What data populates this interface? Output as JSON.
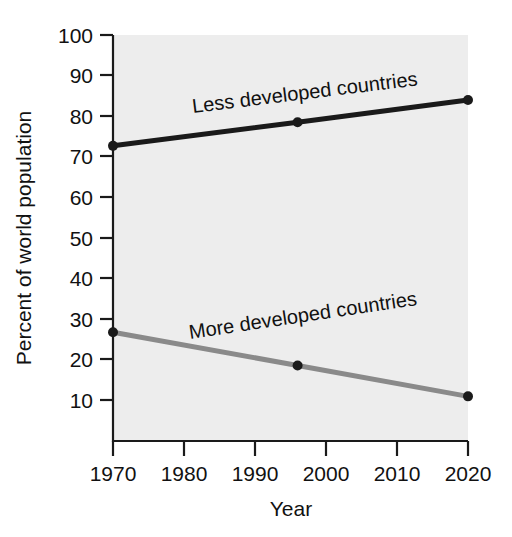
{
  "chart_data": {
    "type": "line",
    "title": "",
    "xlabel": "Year",
    "ylabel": "Percent of world population",
    "xlim": [
      1970,
      2020
    ],
    "ylim": [
      0,
      100
    ],
    "xticks": [
      1970,
      1980,
      1990,
      2000,
      2010,
      2020
    ],
    "xtick_labels": [
      "1970",
      "1980",
      "1990",
      "2000",
      "2010",
      "2020"
    ],
    "yticks": [
      10,
      20,
      30,
      40,
      50,
      60,
      70,
      80,
      90,
      100
    ],
    "ytick_labels": [
      "10",
      "20",
      "30",
      "40",
      "50",
      "60",
      "70",
      "80",
      "90",
      "100"
    ],
    "grid": false,
    "legend_position": "inline-labels",
    "plot_background": "#ededed",
    "series": [
      {
        "name": "Less developed countries",
        "label": "Less developed countries",
        "color": "#1a1a1a",
        "x": [
          1970,
          1996,
          2020
        ],
        "values": [
          72.7,
          78.5,
          84.0
        ],
        "markers": true
      },
      {
        "name": "More developed countries",
        "label": "More developed countries",
        "color": "#8a8a8a",
        "x": [
          1970,
          1996,
          2020
        ],
        "values": [
          26.8,
          18.6,
          11.0
        ],
        "markers": true
      }
    ]
  },
  "axes": {
    "y_title": "Percent of world population",
    "x_title": "Year"
  },
  "labels": {
    "less_developed": "Less developed countries",
    "more_developed": "More developed countries"
  }
}
